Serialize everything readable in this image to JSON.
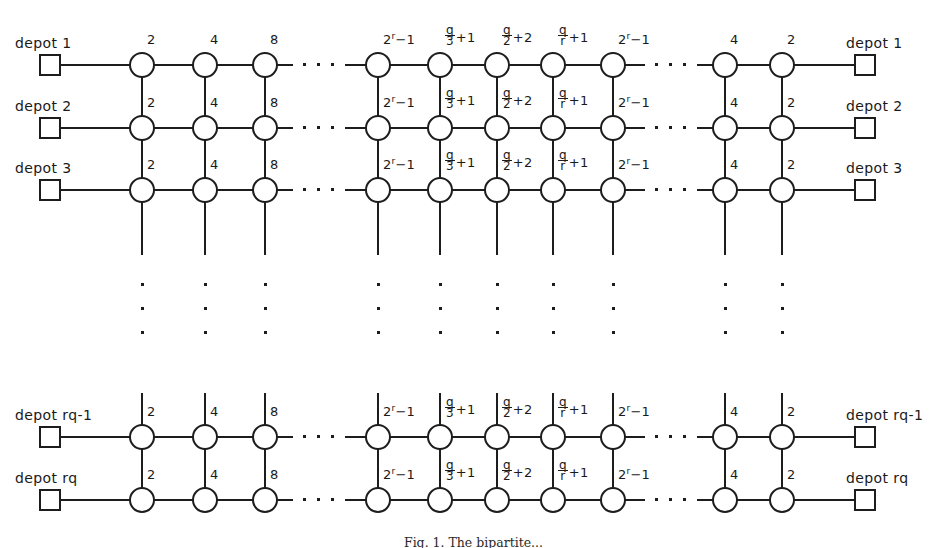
{
  "figure": {
    "caption": "Fig. 1. The bipartite...",
    "line_color": "#1d1d1d",
    "background": "#ffffff"
  },
  "geometry": {
    "width": 947,
    "height": 548,
    "node_radius": 13,
    "depot_size": 22,
    "row_y": [
      65,
      128,
      190,
      437,
      500
    ],
    "col_x": [
      142,
      205,
      265,
      378,
      440,
      497,
      553,
      613,
      725,
      782
    ],
    "left_depot_x": 50,
    "right_depot_x": 865,
    "hdots_x": [
      303,
      655
    ],
    "vdots_y": 283
  },
  "rows": [
    {
      "id": "row-1",
      "y": 65,
      "left_depot": "depot 1",
      "right_depot": "depot 1"
    },
    {
      "id": "row-2",
      "y": 128,
      "left_depot": "depot 2",
      "right_depot": "depot 2"
    },
    {
      "id": "row-3",
      "y": 190,
      "left_depot": "depot 3",
      "right_depot": "depot 3"
    },
    {
      "id": "row-4",
      "y": 437,
      "left_depot": "depot rq-1",
      "right_depot": "depot rq-1"
    },
    {
      "id": "row-5",
      "y": 500,
      "left_depot": "depot rq",
      "right_depot": "depot rq"
    }
  ],
  "column_labels": [
    {
      "kind": "plain",
      "text": "2"
    },
    {
      "kind": "plain",
      "text": "4"
    },
    {
      "kind": "plain",
      "text": "8"
    },
    {
      "kind": "power",
      "base": "2",
      "exponent": "r",
      "tail": "−1",
      "text": "2r−1"
    },
    {
      "kind": "fraction",
      "num": "q",
      "den": "3",
      "tail": "+1",
      "text": "q/3+1"
    },
    {
      "kind": "fraction",
      "num": "q",
      "den": "2",
      "tail": "+2",
      "text": "q/2+2"
    },
    {
      "kind": "fraction",
      "num": "q",
      "den": "r",
      "tail": "+1",
      "text": "q/r+1"
    },
    {
      "kind": "power",
      "base": "2",
      "exponent": "r",
      "tail": "−1",
      "text": "2r−1"
    },
    {
      "kind": "plain",
      "text": "4"
    },
    {
      "kind": "plain",
      "text": "2"
    }
  ],
  "ellipsis": {
    "horizontal_count": 3,
    "vertical_count": 3,
    "dot": "·"
  }
}
